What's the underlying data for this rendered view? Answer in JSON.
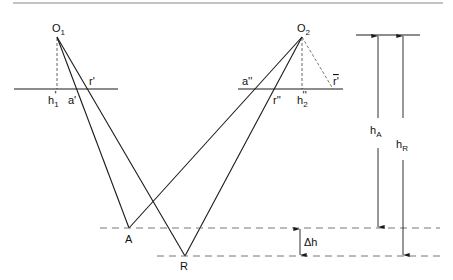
{
  "diagram": {
    "colors": {
      "stroke": "#1a1a1a",
      "dashed": "#555555",
      "border": "#888888"
    },
    "points": {
      "O1": {
        "label": "O",
        "sub": "1"
      },
      "O2": {
        "label": "O",
        "sub": "2"
      },
      "A": {
        "label": "A"
      },
      "R": {
        "label": "R"
      }
    },
    "image_plane_1": {
      "h1": {
        "label": "h",
        "sub": "1",
        "prime": "'"
      },
      "a1": {
        "label": "a'"
      },
      "r1": {
        "label": "r'"
      }
    },
    "image_plane_2": {
      "a2": {
        "label": "a''"
      },
      "r2": {
        "label": "r''"
      },
      "h2": {
        "label": "h",
        "sub": "2",
        "prime": "''"
      },
      "rbar": {
        "label": "r'"
      }
    },
    "dimensions": {
      "hA": {
        "label": "h",
        "sub": "A"
      },
      "hR": {
        "label": "h",
        "sub": "R"
      },
      "dh": {
        "label": "Δh"
      }
    }
  }
}
